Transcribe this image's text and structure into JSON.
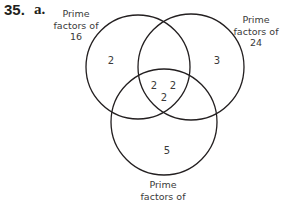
{
  "problem": {
    "number": "35.",
    "part": "a."
  },
  "sets": [
    {
      "id": "A",
      "label_lines": [
        "Prime",
        "factors of",
        "16"
      ]
    },
    {
      "id": "B",
      "label_lines": [
        "Prime",
        "factors of",
        "24"
      ]
    },
    {
      "id": "C",
      "label_lines": [
        "Prime",
        "factors of"
      ]
    }
  ],
  "regions": {
    "A_only": "2",
    "B_only": "3",
    "C_only": "5",
    "center": [
      "2",
      "2",
      "2"
    ]
  }
}
